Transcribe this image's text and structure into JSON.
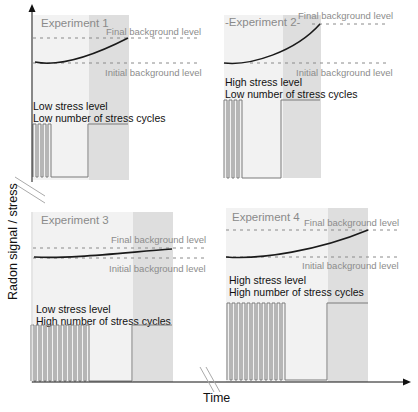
{
  "axes": {
    "y_label": "Radon signal / stress",
    "x_label": "Time"
  },
  "colors": {
    "panel_light": "#f1f1f1",
    "panel_shaded": "#dcdcdc",
    "pulse_stroke": "#7a7a7a",
    "curve": "#1a1a1a",
    "dashed": "#8a8a8a",
    "axis": "#111111"
  },
  "experiments": [
    {
      "title": "Experiment 1",
      "final_label": "Final background level",
      "initial_label": "Initial background level",
      "stress_level": "Low stress level",
      "stress_cycles": "Low number of stress cycles",
      "pulse_count": 4
    },
    {
      "title": "-Experiment 2-",
      "final_label": "Final background level",
      "initial_label": "Initial background level",
      "stress_level": "High stress level",
      "stress_cycles": "Low number of stress cycles",
      "pulse_count": 4
    },
    {
      "title": "Experiment 3",
      "final_label": "Final background level",
      "initial_label": "Initial background level",
      "stress_level": "Low stress level",
      "stress_cycles": "High number of stress cycles",
      "pulse_count": 12
    },
    {
      "title": "Experiment 4",
      "final_label": "Final background level",
      "initial_label": "Initial background level",
      "stress_level": "High stress level",
      "stress_cycles": "High number of stress cycles",
      "pulse_count": 12
    }
  ]
}
